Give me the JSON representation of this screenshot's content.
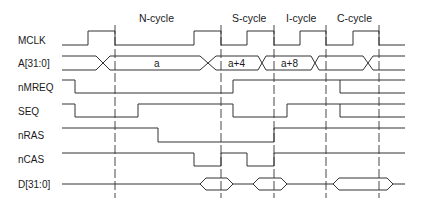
{
  "diagram": {
    "colors": {
      "line": "#333333",
      "text": "#1a1a1a",
      "background": "#ffffff"
    },
    "cycles": [
      {
        "label": "N-cycle",
        "x": 139
      },
      {
        "label": "S-cycle",
        "x": 232
      },
      {
        "label": "I-cycle",
        "x": 286
      },
      {
        "label": "C-cycle",
        "x": 337
      }
    ],
    "boundaries_x": [
      115,
      221,
      274,
      326,
      379
    ],
    "signals": [
      {
        "name": "MCLK",
        "label_y": 44
      },
      {
        "name": "A[31:0]",
        "label_y": 67
      },
      {
        "name": "nMREQ",
        "label_y": 91
      },
      {
        "name": "SEQ",
        "label_y": 115
      },
      {
        "name": "nRAS",
        "label_y": 139
      },
      {
        "name": "nCAS",
        "label_y": 163
      },
      {
        "name": "D[31:0]",
        "label_y": 188
      }
    ],
    "address_values": [
      {
        "text": "a",
        "x": 157
      },
      {
        "text": "a+4",
        "x": 235
      },
      {
        "text": "a+8",
        "x": 290
      }
    ]
  }
}
